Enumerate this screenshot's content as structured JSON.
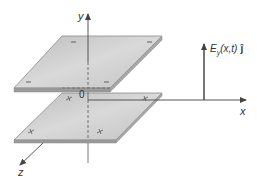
{
  "diagram": {
    "type": "parallel-plate-3d",
    "axes": {
      "y_label": "y",
      "x_label": "x",
      "z_label": "z",
      "origin_label": "0"
    },
    "plates": [
      {
        "name": "top-plate",
        "charge_sign": "−",
        "marks": [
          "−",
          "−",
          "−",
          "−"
        ]
      },
      {
        "name": "bottom-plate",
        "charge_sign": "+",
        "marks": [
          "+",
          "+",
          "+",
          "+"
        ]
      }
    ],
    "field_vector": {
      "label_main": "E",
      "label_sub": "y",
      "label_args": "(x,t)",
      "label_unit": "ĵ",
      "direction": "up"
    },
    "colors": {
      "plate_fill": "#c8c8c8",
      "plate_edge": "#8a8a8a",
      "axis": "#555555",
      "arrow": "#555555",
      "text": "#333333"
    }
  }
}
